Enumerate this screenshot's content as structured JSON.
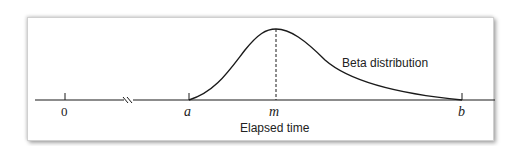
{
  "diagram": {
    "curve_label": "Beta distribution",
    "x_axis_label": "Elapsed time",
    "ticks": [
      {
        "label": "0",
        "x": 65
      },
      {
        "label": "a",
        "x": 189
      },
      {
        "label": "m",
        "x": 276
      },
      {
        "label": "b",
        "x": 462
      }
    ],
    "axis_break": true,
    "mode_marker": "m",
    "colors": {
      "line": "#1a1a1a",
      "frame_shadow": "#9a9a9a"
    }
  }
}
